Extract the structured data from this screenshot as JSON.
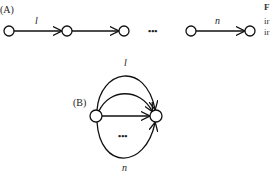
{
  "panel_a": {
    "label": "(A)",
    "edge_first_label": "l",
    "ellipsis": "•••",
    "edge_last_label": "n"
  },
  "panel_b": {
    "label": "(B)",
    "edge_top_label": "l",
    "ellipsis": "•••",
    "edge_bottom_label": "n"
  },
  "side_text": {
    "line1": "F",
    "line2": "ir",
    "line3": "ir"
  }
}
